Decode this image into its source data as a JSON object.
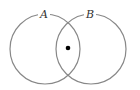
{
  "diagram": {
    "type": "venn",
    "sets": [
      {
        "label": "A",
        "cx": 45,
        "cy": 49,
        "r": 35,
        "label_x": 44,
        "label_y": 18
      },
      {
        "label": "B",
        "cx": 91,
        "cy": 49,
        "r": 35,
        "label_x": 90,
        "label_y": 18
      }
    ],
    "point": {
      "cx": 68,
      "cy": 48,
      "r": 2.3,
      "region": "A ∩ B"
    },
    "colors": {
      "stroke": "#888888",
      "point": "#000000",
      "label": "#333333"
    }
  }
}
